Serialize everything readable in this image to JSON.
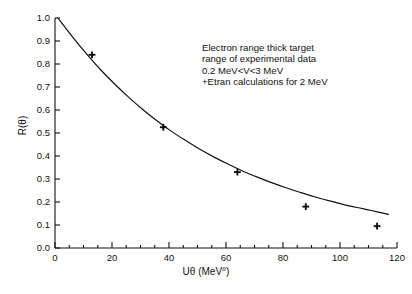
{
  "chart_data": {
    "type": "line",
    "title": "",
    "xlabel": "Uθ (MeV°)",
    "ylabel": "R(θ)",
    "xlim": [
      0,
      120
    ],
    "ylim": [
      0.0,
      1.0
    ],
    "grid": false,
    "legend": null,
    "xticks": [
      0,
      20,
      40,
      60,
      80,
      100,
      120
    ],
    "xtick_labels": [
      "0",
      "20",
      "40",
      "60",
      "80",
      "100",
      "120"
    ],
    "xminor_step": 5,
    "yticks": [
      0.0,
      0.1,
      0.2,
      0.3,
      0.4,
      0.5,
      0.6,
      0.7,
      0.8,
      0.9,
      1.0
    ],
    "ytick_labels": [
      "0.0",
      "0.1",
      "0.2",
      "0.3",
      "0.4",
      "0.5",
      "0.6",
      "0.7",
      "0.8",
      "0.9",
      "1.0"
    ],
    "series": [
      {
        "name": "fitted curve",
        "type": "line",
        "marker": "none",
        "color": "#111111",
        "x": [
          1,
          6,
          11,
          16,
          21,
          26,
          31,
          36,
          41,
          46,
          51,
          56,
          61,
          66,
          71,
          76,
          81,
          86,
          91,
          96,
          101,
          106,
          111,
          117
        ],
        "y": [
          1.0,
          0.92,
          0.845,
          0.775,
          0.712,
          0.654,
          0.6,
          0.551,
          0.506,
          0.466,
          0.428,
          0.394,
          0.363,
          0.334,
          0.308,
          0.284,
          0.262,
          0.242,
          0.223,
          0.206,
          0.19,
          0.176,
          0.163,
          0.146
        ]
      },
      {
        "name": "Etran calculations for 2 MeV",
        "type": "scatter",
        "marker": "plus",
        "color": "#111111",
        "x": [
          13,
          38,
          64,
          88,
          113
        ],
        "y": [
          0.84,
          0.525,
          0.33,
          0.18,
          0.095
        ]
      }
    ],
    "annotations": [
      "Electron range thick target",
      "range of experimental data",
      "0.2 MeV<V<3 MeV",
      "+Etran calculations for 2 MeV"
    ]
  },
  "figure": {
    "background_color": "#ffffff",
    "axis_color": "#111111"
  }
}
